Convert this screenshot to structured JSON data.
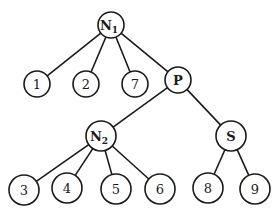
{
  "diagram": {
    "type": "tree",
    "stroke_color": "#1a1a1a",
    "background": "#ffffff",
    "nodes": [
      {
        "id": "N1",
        "label": "N",
        "sub": "1",
        "x": 111,
        "y": 25,
        "r": 13,
        "bold": true
      },
      {
        "id": "1",
        "label": "1",
        "x": 37,
        "y": 84,
        "r": 13
      },
      {
        "id": "2",
        "label": "2",
        "x": 86,
        "y": 84,
        "r": 13
      },
      {
        "id": "7",
        "label": "7",
        "x": 135,
        "y": 84,
        "r": 13
      },
      {
        "id": "P",
        "label": "P",
        "x": 178,
        "y": 80,
        "r": 13,
        "bold": true
      },
      {
        "id": "N2",
        "label": "N",
        "sub": "2",
        "x": 101,
        "y": 136,
        "r": 15,
        "bold": true
      },
      {
        "id": "S",
        "label": "S",
        "x": 231,
        "y": 136,
        "r": 15,
        "bold": true
      },
      {
        "id": "3",
        "label": "3",
        "x": 24,
        "y": 190,
        "r": 15
      },
      {
        "id": "4",
        "label": "4",
        "x": 67,
        "y": 188,
        "r": 15
      },
      {
        "id": "5",
        "label": "5",
        "x": 116,
        "y": 189,
        "r": 15
      },
      {
        "id": "6",
        "label": "6",
        "x": 160,
        "y": 189,
        "r": 15
      },
      {
        "id": "8",
        "label": "8",
        "x": 208,
        "y": 188,
        "r": 15
      },
      {
        "id": "9",
        "label": "9",
        "x": 255,
        "y": 189,
        "r": 15
      }
    ],
    "edges": [
      [
        "N1",
        "1"
      ],
      [
        "N1",
        "2"
      ],
      [
        "N1",
        "7"
      ],
      [
        "N1",
        "P"
      ],
      [
        "P",
        "N2"
      ],
      [
        "P",
        "S"
      ],
      [
        "N2",
        "3"
      ],
      [
        "N2",
        "4"
      ],
      [
        "N2",
        "5"
      ],
      [
        "N2",
        "6"
      ],
      [
        "S",
        "8"
      ],
      [
        "S",
        "9"
      ]
    ]
  }
}
